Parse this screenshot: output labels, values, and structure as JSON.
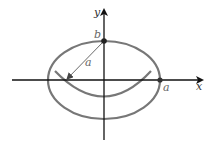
{
  "diagram": {
    "axes": {
      "x_label": "x",
      "y_label": "y"
    },
    "ellipse": {
      "center": [
        104,
        80
      ],
      "rx": 56,
      "ry": 39,
      "color": "#777777"
    },
    "arc": {
      "start": [
        55,
        71
      ],
      "control": [
        104,
        122
      ],
      "end": [
        151,
        71
      ],
      "color": "#777777"
    },
    "points": [
      {
        "name": "b",
        "x": 104,
        "y": 41,
        "label": "b"
      },
      {
        "name": "a",
        "x": 160,
        "y": 80,
        "label": "a"
      }
    ],
    "radius_line": {
      "from": [
        104,
        41
      ],
      "to": [
        66,
        80
      ],
      "label": "a"
    },
    "colors": {
      "axis": "#111111",
      "curve": "#777777",
      "label": "#555555",
      "point": "#222222"
    }
  }
}
